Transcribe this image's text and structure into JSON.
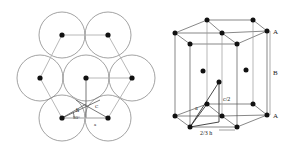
{
  "figure": {
    "left_panel": {
      "title": "Hexagonal close-packed layer (top view)",
      "circles": [
        {
          "cx": 62,
          "cy": 35
        },
        {
          "cx": 108,
          "cy": 35
        },
        {
          "cx": 40,
          "cy": 78
        },
        {
          "cx": 86,
          "cy": 78
        },
        {
          "cx": 132,
          "cy": 78
        },
        {
          "cx": 62,
          "cy": 118
        },
        {
          "cx": 108,
          "cy": 118
        }
      ],
      "radius": 23,
      "labels": {
        "h": "h",
        "angle": "30°",
        "a": "a",
        "c": "C"
      }
    },
    "right_panel": {
      "title": "HCP unit cell",
      "labels": {
        "top_layer": "A",
        "middle_layer": "B",
        "bottom_layer": "A",
        "half_c": "c/2",
        "lattice_a": "a",
        "two_thirds_h": "2/3 h"
      }
    },
    "colors": {
      "atom": "#111111",
      "circle_stroke": "#777777",
      "line": "#555555",
      "light_line": "#aaaaaa"
    }
  }
}
